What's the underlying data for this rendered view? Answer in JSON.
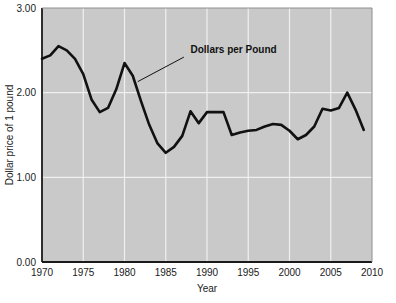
{
  "chart_data": {
    "type": "line",
    "title": "",
    "xlabel": "Year",
    "ylabel": "Dollar price of 1 pound",
    "xlim": [
      1970,
      2010
    ],
    "ylim": [
      0.0,
      3.0
    ],
    "grid": true,
    "legend_position": "none",
    "plot_background": "#c9c9c9",
    "line_color": "#111111",
    "x_ticks": [
      1970,
      1975,
      1980,
      1985,
      1990,
      1995,
      2000,
      2005,
      2010
    ],
    "x_tick_labels": [
      "1970",
      "1975",
      "1980",
      "1985",
      "1990",
      "1995",
      "2000",
      "2005",
      "2010"
    ],
    "y_ticks": [
      0.0,
      1.0,
      2.0,
      3.0
    ],
    "y_tick_labels": [
      "0.00",
      "1.00",
      "2.00",
      "3.00"
    ],
    "gridlines_x": [
      1975,
      1980,
      1985,
      1990,
      1995,
      2000,
      2005
    ],
    "gridlines_y": [
      1.0,
      2.0
    ],
    "series": [
      {
        "name": "Dollars per Pound",
        "x": [
          1970,
          1971,
          1972,
          1973,
          1974,
          1975,
          1976,
          1977,
          1978,
          1979,
          1980,
          1981,
          1982,
          1983,
          1984,
          1985,
          1986,
          1987,
          1988,
          1989,
          1990,
          1991,
          1992,
          1993,
          1994,
          1995,
          1996,
          1997,
          1998,
          1999,
          2000,
          2001,
          2002,
          2003,
          2004,
          2005,
          2006,
          2007,
          2008,
          2009
        ],
        "values": [
          2.4,
          2.44,
          2.55,
          2.5,
          2.4,
          2.22,
          1.92,
          1.77,
          1.82,
          2.04,
          2.35,
          2.2,
          1.9,
          1.62,
          1.4,
          1.29,
          1.36,
          1.49,
          1.78,
          1.64,
          1.77,
          1.77,
          1.77,
          1.5,
          1.53,
          1.55,
          1.56,
          1.6,
          1.63,
          1.62,
          1.55,
          1.45,
          1.5,
          1.6,
          1.81,
          1.79,
          1.82,
          2.0,
          1.8,
          1.56
        ]
      }
    ],
    "annotations": [
      {
        "text": "Dollars per Pound",
        "label_x": 1988,
        "label_y": 2.5,
        "leader_from_x": 1981.6,
        "leader_from_y": 2.13,
        "leader_to_x": 1987.2,
        "leader_to_y": 2.42
      }
    ]
  }
}
